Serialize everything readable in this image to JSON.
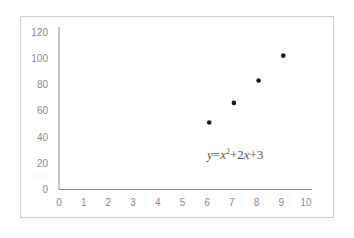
{
  "chart_data": {
    "type": "scatter",
    "title": "",
    "xlabel": "",
    "ylabel": "",
    "xlim": [
      0,
      10
    ],
    "ylim": [
      0,
      120
    ],
    "x_ticks": [
      "0",
      "1",
      "2",
      "3",
      "4",
      "5",
      "6",
      "7",
      "8",
      "9",
      "10"
    ],
    "y_ticks": [
      "0",
      "20",
      "40",
      "60",
      "80",
      "100",
      "120"
    ],
    "grid": false,
    "legend": null,
    "series": [
      {
        "name": "points",
        "x": [
          6,
          7,
          8,
          9
        ],
        "y": [
          51,
          66,
          83,
          102
        ],
        "color": "#1a1a1a"
      }
    ],
    "annotations": [
      {
        "text": "y=x²+2x+3",
        "x": 6.1,
        "y": 24,
        "style": "italic serif"
      }
    ]
  },
  "equation": {
    "y": "y",
    "eq1": "=",
    "x": "x",
    "sup": "2",
    "plus1": "+2",
    "x2": "x",
    "plus2": "+3"
  },
  "colors": {
    "axis": "#8c8c8c",
    "frame": "#cfcfcf",
    "tick_text": "#8a8a8a",
    "marker": "#1a1a1a"
  }
}
